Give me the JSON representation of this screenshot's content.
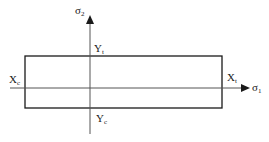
{
  "diagram": {
    "type": "failure-envelope",
    "axes": {
      "horizontal": {
        "symbol": "σ",
        "subscript": "1"
      },
      "vertical": {
        "symbol": "σ",
        "subscript": "2"
      }
    },
    "labels": {
      "Xt": {
        "main": "X",
        "sub": "t"
      },
      "Xc": {
        "main": "X",
        "sub": "c"
      },
      "Yt": {
        "main": "Y",
        "sub": "t"
      },
      "Yc": {
        "main": "Y",
        "sub": "c"
      }
    },
    "stroke_color": "#1a1a1a",
    "axis_color": "#555555"
  }
}
